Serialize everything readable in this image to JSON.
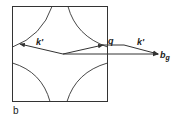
{
  "figure": {
    "panel_label": "b",
    "labels": {
      "k_prime_left": "k'",
      "k_prime_right": "k'",
      "q": "q",
      "b_g_main": "b",
      "b_g_sub": "g"
    },
    "colors": {
      "stroke": "#333333",
      "background": "#ffffff"
    }
  }
}
